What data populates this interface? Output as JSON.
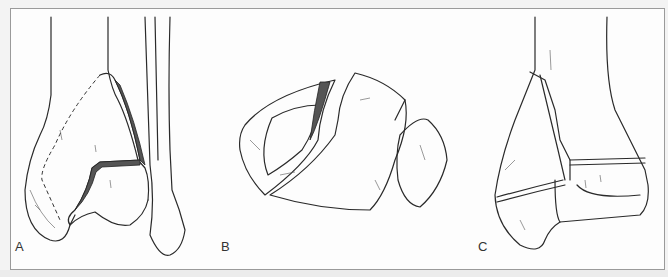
{
  "figure": {
    "panels": [
      {
        "id": "A",
        "label": "A",
        "subject": "distal tibia and fibula, anterior view, fracture with displaced fragment"
      },
      {
        "id": "B",
        "label": "B",
        "subject": "distal tibial articular surface, axial view, with fibula"
      },
      {
        "id": "C",
        "label": "C",
        "subject": "distal tibia, lateral view, fracture through physis"
      }
    ]
  }
}
